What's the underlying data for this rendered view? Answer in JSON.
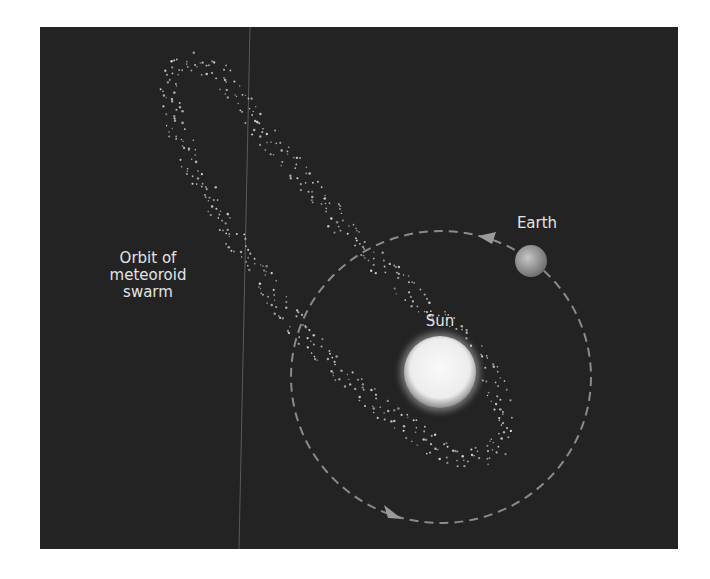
{
  "diagram": {
    "background_color": "#232323",
    "page_color": "#ffffff",
    "labels": {
      "swarm_line1": "Orbit of",
      "swarm_line2": "meteoroid",
      "swarm_line3": "swarm",
      "earth": "Earth",
      "sun": "Sun"
    },
    "bodies": {
      "sun": {
        "cx": 440,
        "cy": 372,
        "r": 36,
        "color": "#f2f2f2"
      },
      "earth": {
        "cx": 531,
        "cy": 261,
        "r": 16,
        "color": "#a8a8a8"
      }
    },
    "earth_orbit": {
      "cx": 441,
      "cy": 377,
      "rx": 150,
      "ry": 146,
      "style": "dashed",
      "color": "#8a8a8a"
    },
    "arrows": [
      {
        "name": "earth-direction-arrow",
        "at": [
          480,
          236
        ],
        "direction": "left"
      },
      {
        "name": "orbit-direction-arrow",
        "at": [
          396,
          515
        ],
        "direction": "right-down"
      }
    ]
  }
}
